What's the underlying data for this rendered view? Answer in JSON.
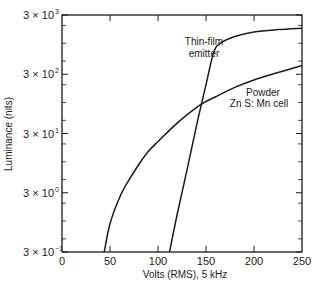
{
  "chart_data": {
    "type": "line",
    "title": "",
    "xlabel": "Volts (RMS), 5 kHz",
    "ylabel": "Luminance (nits)",
    "xlim": [
      0,
      250
    ],
    "ylim": [
      0.3,
      3000
    ],
    "yscale": "log",
    "grid": false,
    "xticks": [
      0,
      50,
      100,
      150,
      200,
      250
    ],
    "xtick_labels": [
      "0",
      "50",
      "100",
      "150",
      "200",
      "250"
    ],
    "yticks": [
      0.3,
      3,
      30,
      300,
      3000
    ],
    "ytick_labels": [
      {
        "mantissa": "3 × 10",
        "exp": "−1"
      },
      {
        "mantissa": "3 × 10",
        "exp": "0"
      },
      {
        "mantissa": "3 × 10",
        "exp": "1"
      },
      {
        "mantissa": "3 × 10",
        "exp": "2"
      },
      {
        "mantissa": "3 × 10",
        "exp": "3"
      }
    ],
    "series": [
      {
        "name": "Thin-film emitter",
        "label_lines": [
          "Thin-film",
          "emitter"
        ],
        "x": [
          112,
          120,
          130,
          140,
          150,
          158,
          165,
          180,
          200,
          225,
          250
        ],
        "y": [
          0.3,
          1.3,
          7,
          40,
          200,
          700,
          1000,
          1300,
          1550,
          1700,
          1800
        ]
      },
      {
        "name": "Powder ZnS: Mn cell",
        "label_lines": [
          "Powder",
          "Zn S: Mn cell"
        ],
        "x": [
          44,
          50,
          60,
          70,
          80,
          90,
          100,
          120,
          144,
          160,
          180,
          200,
          225,
          250
        ],
        "y": [
          0.3,
          0.9,
          2.5,
          5,
          9,
          15,
          22,
          45,
          91,
          125,
          180,
          240,
          320,
          420
        ]
      }
    ],
    "legend": "none (inline annotations)"
  }
}
